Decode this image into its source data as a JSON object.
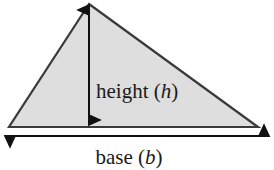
{
  "figure": {
    "background_color": "#ffffff",
    "shape": {
      "name": "triangle",
      "fill_color": "#dedede",
      "stroke_color": "#3a3a3a",
      "stroke_width": 2.2,
      "vertices": [
        {
          "label": "apex",
          "x": 89,
          "y": 4
        },
        {
          "label": "bottom-right",
          "x": 258,
          "y": 127
        },
        {
          "label": "bottom-left",
          "x": 9,
          "y": 127
        }
      ]
    },
    "height_dimension": {
      "name": "height-arrow",
      "orientation": "vertical",
      "double_headed": true,
      "color": "#111111",
      "x": 89,
      "y_top": 3,
      "y_bottom": 127,
      "label_prefix": "height (",
      "label_variable": "h",
      "label_suffix": ")",
      "label_x": 96,
      "label_y": 98,
      "font_size": 21
    },
    "base_dimension": {
      "name": "base-arrow",
      "orientation": "horizontal",
      "double_headed": true,
      "color": "#111111",
      "y": 136,
      "x_left": 3,
      "x_right": 271,
      "label_prefix": "base (",
      "label_variable": "b",
      "label_suffix": ")",
      "label_x": 129,
      "label_y": 164,
      "font_size": 21
    }
  }
}
